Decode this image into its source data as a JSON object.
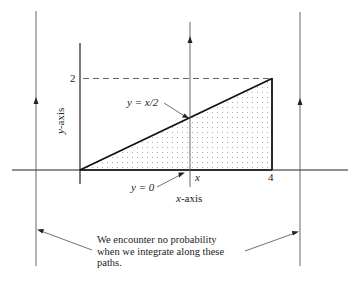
{
  "diagram": {
    "type": "integration-region",
    "labels": {
      "y_tick_2": "2",
      "x_tick_4": "4",
      "x_tick_x": "x",
      "y_axis": "y-axis",
      "x_axis": "x-axis",
      "line_upper": "y = x/2",
      "line_lower": "y = 0"
    },
    "annotation": {
      "line1": "We encounter no probability",
      "line2": "when we integrate along these",
      "line3": "paths."
    },
    "region": {
      "description": "Triangle bounded by y = 0, y = x/2, and x = 4 (dotted shading)",
      "vertices": [
        [
          0,
          0
        ],
        [
          4,
          0
        ],
        [
          4,
          2
        ]
      ]
    },
    "colors": {
      "line": "#222222",
      "thin_line": "#555555",
      "dots": "#999999"
    }
  }
}
